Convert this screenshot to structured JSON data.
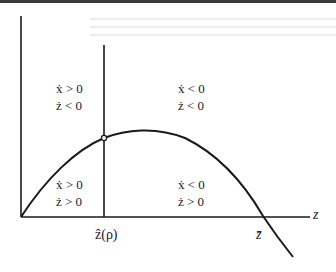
{
  "axes": {
    "x_label": "z",
    "ticks": [
      {
        "id": "z_hat",
        "label": "ẑ(ρ)"
      },
      {
        "id": "z_bar",
        "label": "z̄"
      }
    ]
  },
  "regions": {
    "top_left": {
      "line1": "ẋ > 0",
      "line2": "ż < 0"
    },
    "top_right": {
      "line1": "ẋ < 0",
      "line2": "ż < 0"
    },
    "bottom_left": {
      "line1": "ẋ > 0",
      "line2": "ż > 0"
    },
    "bottom_right": {
      "line1": "ẋ < 0",
      "line2": "ż > 0"
    }
  },
  "geometry": {
    "origin": [
      21,
      217
    ],
    "y_axis_top": 16,
    "x_axis_end": 310,
    "z_hat_x": 104,
    "z_hat_line_top": 45,
    "intersection_point": [
      104,
      138
    ],
    "curve_peak": [
      140,
      130
    ],
    "z_bar_x": 263,
    "curve_end": [
      293,
      257
    ]
  },
  "colors": {
    "line": "#1a1a1a",
    "background": "#ffffff"
  }
}
